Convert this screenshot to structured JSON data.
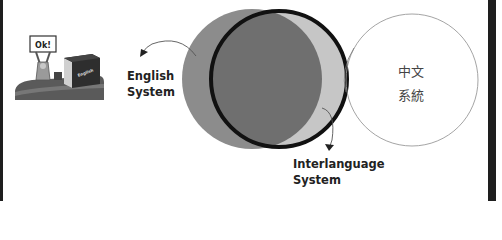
{
  "diagram": {
    "type": "venn",
    "illustration": {
      "sign_text": "Ok!",
      "box_text": "English"
    },
    "circles": [
      {
        "id": "english",
        "label_lines": [
          "English",
          "System"
        ],
        "fill": "#8a8a8a"
      },
      {
        "id": "interlanguage",
        "label_lines": [
          "Interlanguage",
          "System"
        ],
        "stroke": "#111111",
        "fill": "#c4c4c4",
        "overlap_fill": "#6e6e6e"
      },
      {
        "id": "chinese",
        "label_lines": [
          "中文",
          "系統"
        ],
        "stroke": "#9a9a9a",
        "fill": "#ffffff"
      }
    ]
  },
  "labels": {
    "english": {
      "line1": "English",
      "line2": "System"
    },
    "interlanguage": {
      "line1": "Interlanguage",
      "line2": "System"
    },
    "chinese": {
      "line1": "中文",
      "line2": "系統"
    }
  },
  "colors": {
    "frame": "#1e1e1e",
    "english_circle": "#8a8a8a",
    "overlap": "#6e6e6e",
    "interlanguage_only": "#c4c4c4",
    "interlanguage_stroke": "#111111",
    "chinese_stroke": "#9a9a9a"
  }
}
